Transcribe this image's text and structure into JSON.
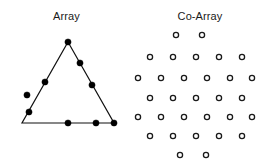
{
  "figure": {
    "background_color": "#ffffff",
    "foreground_color": "#1a1a1a",
    "panels": [
      {
        "id": "array",
        "title": "Array"
      },
      {
        "id": "coarray",
        "title": "Co-Array"
      }
    ]
  },
  "chart_data": {
    "type": "scatter",
    "xlabel": "",
    "ylabel": "",
    "grid": false,
    "legend": null,
    "panels": [
      {
        "name": "Array",
        "title": "Array",
        "description": "Triangular sensor array: filled dots placed along the outline of an equilateral-style triangle",
        "marker": "filled-circle",
        "marker_color": "#000000",
        "marker_radius": 3.1,
        "outline": {
          "shape": "triangle",
          "stroke_color": "#111111",
          "stroke_width": 1.2,
          "vertices": [
            {
              "x": 68,
              "y": 42
            },
            {
              "x": 114,
              "y": 123
            },
            {
              "x": 22,
              "y": 123
            }
          ]
        },
        "points": [
          {
            "x": 80,
            "y": 63
          },
          {
            "x": 92,
            "y": 85
          },
          {
            "x": 96,
            "y": 123
          },
          {
            "x": 68,
            "y": 123
          },
          {
            "x": 29,
            "y": 112
          },
          {
            "x": 27,
            "y": 95
          },
          {
            "x": 45,
            "y": 82
          },
          {
            "x": 68,
            "y": 42
          },
          {
            "x": 114,
            "y": 123
          }
        ],
        "n_points": 9,
        "xlim": [
          0,
          133
        ],
        "ylim": [
          163,
          0
        ]
      },
      {
        "name": "Co-Array",
        "title": "Co-Array",
        "description": "Difference co-array of the triangular array: open circles arranged in a hexagonal lattice with rows of 2, 5, 6, 5, 6, 5, 2 elements",
        "marker": "open-circle",
        "marker_edge_color": "#1a1a1a",
        "marker_face_color": "#ffffff",
        "marker_radius": 2.6,
        "rows": [
          {
            "y": 35,
            "count": 2,
            "x": [
              176,
              202
            ]
          },
          {
            "y": 57,
            "count": 5,
            "x": [
              150,
              173,
              196,
              219,
              242
            ]
          },
          {
            "y": 78,
            "count": 6,
            "x": [
              138,
              161,
              184,
              207,
              230,
              252
            ]
          },
          {
            "y": 98,
            "count": 5,
            "x": [
              150,
              173,
              196,
              219,
              242
            ]
          },
          {
            "y": 117,
            "count": 6,
            "x": [
              138,
              161,
              184,
              207,
              230,
              252
            ]
          },
          {
            "y": 136,
            "count": 5,
            "x": [
              150,
              173,
              196,
              219,
              242
            ]
          },
          {
            "y": 155,
            "count": 2,
            "x": [
              180,
              206
            ]
          }
        ],
        "n_points": 31,
        "xlim": [
          133,
          267
        ],
        "ylim": [
          163,
          0
        ]
      }
    ]
  }
}
